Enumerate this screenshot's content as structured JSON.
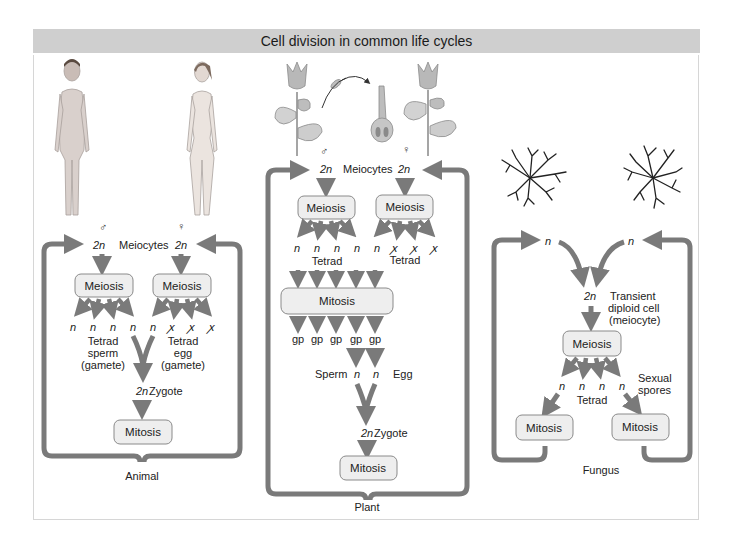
{
  "title": "Cell division in common life cycles",
  "colors": {
    "arrow": "#7a7a7a",
    "box_fill": "#eeeeee",
    "box_stroke": "#8a8a8a",
    "title_bg": "#cfcfcf",
    "panel_border": "#d6d6d6"
  },
  "symbols": {
    "male": "♂",
    "female": "♀",
    "n": "n",
    "two_n": "2n",
    "degenerate": "ꭗ"
  },
  "animal": {
    "caption": "Animal",
    "meiocytes": "Meiocytes",
    "left_meiosis": "Meiosis",
    "right_meiosis": "Meiosis",
    "left_tetrad": [
      "Tetrad",
      "sperm",
      "(gamete)"
    ],
    "right_tetrad": [
      "Tetrad",
      "egg",
      "(gamete)"
    ],
    "zygote": "Zygote",
    "mitosis": "Mitosis"
  },
  "plant": {
    "caption": "Plant",
    "meiocytes": "Meiocytes",
    "left_meiosis": "Meiosis",
    "right_meiosis": "Meiosis",
    "tetrad": "Tetrad",
    "mitosis_wide": "Mitosis",
    "gp": "gp",
    "sperm": "Sperm",
    "egg": "Egg",
    "zygote": "Zygote",
    "mitosis": "Mitosis"
  },
  "fungus": {
    "caption": "Fungus",
    "transient": [
      "Transient",
      "diploid cell",
      "(meiocyte)"
    ],
    "meiosis": "Meiosis",
    "tetrad": "Tetrad",
    "sexual_spores": [
      "Sexual",
      "spores"
    ],
    "left_mitosis": "Mitosis",
    "right_mitosis": "Mitosis"
  }
}
